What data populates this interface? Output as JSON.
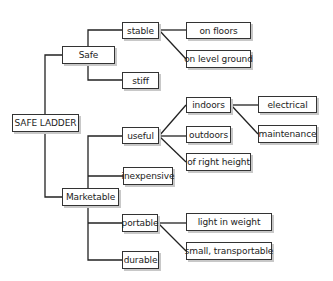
{
  "diagram": {
    "type": "tree",
    "root": "SAFE LADDER",
    "nodes": {
      "root": "SAFE LADDER",
      "safe": "Safe",
      "stable": "stable",
      "on_floors": "on floors",
      "on_level_ground": "on level ground",
      "stiff": "stiff",
      "marketable": "Marketable",
      "useful": "useful",
      "indoors": "indoors",
      "electrical": "electrical",
      "maintenance": "maintenance",
      "outdoors": "outdoors",
      "of_right_height": "of right height",
      "inexpensive": "inexpensive",
      "portable": "portable",
      "light_in_weight": "light in weight",
      "small_transportable": "small, transportable",
      "durable": "durable"
    },
    "edges": [
      [
        "SAFE LADDER",
        "Safe"
      ],
      [
        "SAFE LADDER",
        "Marketable"
      ],
      [
        "Safe",
        "stable"
      ],
      [
        "Safe",
        "stiff"
      ],
      [
        "stable",
        "on floors"
      ],
      [
        "stable",
        "on level ground"
      ],
      [
        "Marketable",
        "useful"
      ],
      [
        "Marketable",
        "inexpensive"
      ],
      [
        "Marketable",
        "portable"
      ],
      [
        "Marketable",
        "durable"
      ],
      [
        "useful",
        "indoors"
      ],
      [
        "useful",
        "outdoors"
      ],
      [
        "useful",
        "of right height"
      ],
      [
        "indoors",
        "electrical"
      ],
      [
        "indoors",
        "maintenance"
      ],
      [
        "portable",
        "light in weight"
      ],
      [
        "portable",
        "small, transportable"
      ]
    ]
  }
}
